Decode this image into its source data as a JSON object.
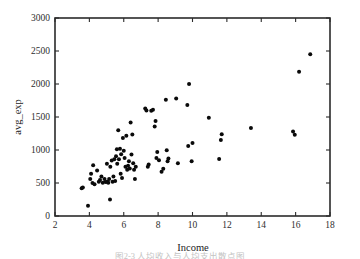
{
  "figure": {
    "caption": "图2-3 人均收入与人均支出散点图"
  },
  "chart_data": {
    "type": "scatter",
    "title": "",
    "xlabel": "Income",
    "ylabel": "avg_exp",
    "xlim": [
      2,
      18
    ],
    "ylim": [
      0,
      3000
    ],
    "xticks": [
      2,
      4,
      6,
      8,
      10,
      12,
      14,
      16,
      18
    ],
    "yticks": [
      0,
      500,
      1000,
      1500,
      2000,
      2500,
      3000
    ],
    "xtick_labels": [
      "2",
      "4",
      "6",
      "8",
      "10",
      "12",
      "14",
      "16",
      "18"
    ],
    "ytick_labels": [
      "0",
      "500",
      "1000",
      "1500",
      "2000",
      "2500",
      "3000"
    ],
    "grid": false,
    "legend": false,
    "marker": "filled-circle",
    "marker_color": "#0a0a0a",
    "marker_size": 4,
    "points": [
      [
        3.55,
        420
      ],
      [
        3.62,
        430
      ],
      [
        3.92,
        155
      ],
      [
        4.05,
        560
      ],
      [
        4.1,
        640
      ],
      [
        4.18,
        500
      ],
      [
        4.22,
        770
      ],
      [
        4.3,
        480
      ],
      [
        4.45,
        690
      ],
      [
        4.55,
        520
      ],
      [
        4.62,
        545
      ],
      [
        4.7,
        600
      ],
      [
        4.78,
        505
      ],
      [
        4.88,
        560
      ],
      [
        4.95,
        515
      ],
      [
        5.02,
        790
      ],
      [
        5.05,
        520
      ],
      [
        5.1,
        505
      ],
      [
        5.15,
        560
      ],
      [
        5.2,
        250
      ],
      [
        5.22,
        745
      ],
      [
        5.3,
        840
      ],
      [
        5.35,
        520
      ],
      [
        5.4,
        600
      ],
      [
        5.45,
        860
      ],
      [
        5.5,
        530
      ],
      [
        5.55,
        905
      ],
      [
        5.6,
        1010
      ],
      [
        5.62,
        790
      ],
      [
        5.68,
        1300
      ],
      [
        5.72,
        860
      ],
      [
        5.78,
        1020
      ],
      [
        5.82,
        640
      ],
      [
        5.85,
        935
      ],
      [
        5.9,
        575
      ],
      [
        5.95,
        1180
      ],
      [
        6.0,
        990
      ],
      [
        6.05,
        880
      ],
      [
        6.1,
        745
      ],
      [
        6.15,
        1215
      ],
      [
        6.2,
        700
      ],
      [
        6.25,
        760
      ],
      [
        6.3,
        830
      ],
      [
        6.35,
        720
      ],
      [
        6.4,
        1415
      ],
      [
        6.45,
        930
      ],
      [
        6.5,
        1235
      ],
      [
        6.55,
        800
      ],
      [
        6.6,
        700
      ],
      [
        6.65,
        560
      ],
      [
        6.7,
        745
      ],
      [
        7.25,
        1630
      ],
      [
        7.32,
        1600
      ],
      [
        7.4,
        745
      ],
      [
        7.45,
        780
      ],
      [
        7.6,
        1595
      ],
      [
        7.7,
        1610
      ],
      [
        7.8,
        1355
      ],
      [
        7.85,
        1440
      ],
      [
        7.9,
        880
      ],
      [
        7.95,
        970
      ],
      [
        8.05,
        845
      ],
      [
        8.2,
        670
      ],
      [
        8.3,
        715
      ],
      [
        8.45,
        1760
      ],
      [
        8.5,
        995
      ],
      [
        8.55,
        830
      ],
      [
        8.6,
        870
      ],
      [
        9.05,
        1780
      ],
      [
        9.15,
        800
      ],
      [
        9.7,
        1680
      ],
      [
        9.75,
        1060
      ],
      [
        9.8,
        2000
      ],
      [
        9.95,
        830
      ],
      [
        10.0,
        1105
      ],
      [
        10.95,
        1490
      ],
      [
        11.55,
        865
      ],
      [
        11.65,
        1150
      ],
      [
        11.7,
        1240
      ],
      [
        13.4,
        1335
      ],
      [
        15.85,
        1280
      ],
      [
        15.95,
        1230
      ],
      [
        16.2,
        2185
      ],
      [
        16.85,
        2450
      ]
    ]
  }
}
